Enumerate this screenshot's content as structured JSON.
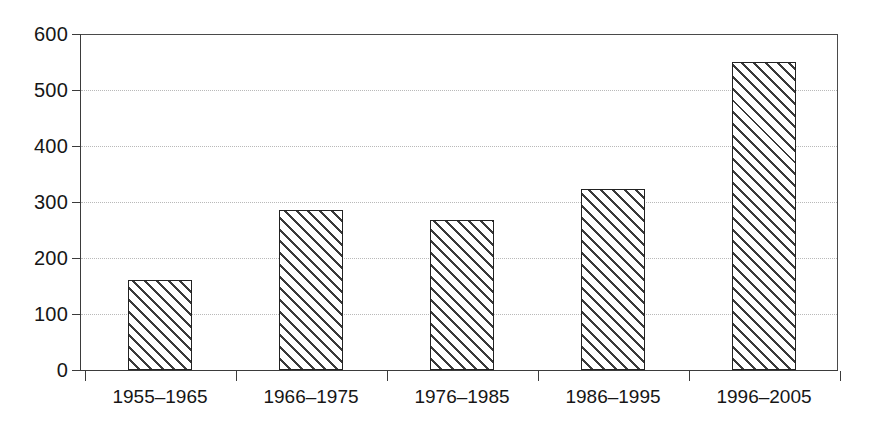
{
  "chart_data": {
    "type": "bar",
    "title": "",
    "subtitle": "",
    "xlabel": "",
    "ylabel": "",
    "categories": [
      "1955–1965",
      "1966–1975",
      "1976–1985",
      "1986–1995",
      "1996–2005"
    ],
    "values": [
      160,
      285,
      267,
      323,
      550
    ],
    "ylim": [
      0,
      600
    ],
    "yticks": [
      0,
      100,
      200,
      300,
      400,
      500,
      600
    ],
    "ytick_labels": [
      "0",
      "100",
      "200",
      "300",
      "400",
      "500",
      "600"
    ],
    "grid": true,
    "grid_axis": "y",
    "grid_style": "dotted",
    "legend": null,
    "legend_position": "none",
    "bar_fill": "diagonal-hatch",
    "bar_edge_color": "#222222",
    "bar_fill_color": "#ffffff",
    "hatch_color": "#3a3a3a",
    "grid_color": "#b9b9b9",
    "axis_color": "#3b3b3b",
    "background_color": "#ffffff",
    "annotations": []
  },
  "layout": {
    "plot_left": 80,
    "plot_top": 34,
    "plot_width": 758,
    "plot_height": 336,
    "baseline_y": 370,
    "bar_width": 64,
    "category_pitch": 151,
    "first_bar_left": 128
  }
}
